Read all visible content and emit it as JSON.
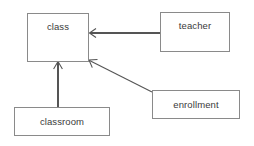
{
  "diagram": {
    "type": "entity-relationship-diagram",
    "width": 254,
    "height": 146,
    "background_color": "#ffffff",
    "box_border_color": "#8a8a8a",
    "arrow_color": "#555555",
    "text_color": "#3a3a3a",
    "entities": [
      {
        "id": "class",
        "label": "class",
        "x": 27,
        "y": 13,
        "width": 62,
        "height": 49
      },
      {
        "id": "teacher",
        "label": "teacher",
        "x": 160,
        "y": 12,
        "width": 70,
        "height": 40
      },
      {
        "id": "enrollment",
        "label": "enrollment",
        "x": 152,
        "y": 90,
        "width": 88,
        "height": 29
      },
      {
        "id": "classroom",
        "label": "classroom",
        "x": 14,
        "y": 107,
        "width": 96,
        "height": 29
      }
    ],
    "relationships": [
      {
        "id": "teacher-to-class",
        "from": "teacher",
        "to": "class",
        "from_point": [
          160,
          33
        ],
        "to_point": [
          90,
          33
        ],
        "style": "open-arrow"
      },
      {
        "id": "enrollment-to-class",
        "from": "enrollment",
        "to": "class",
        "from_point": [
          152,
          92
        ],
        "to_point": [
          89,
          61
        ],
        "style": "open-arrow"
      },
      {
        "id": "classroom-to-class",
        "from": "classroom",
        "to": "class",
        "from_point": [
          58,
          107
        ],
        "to_point": [
          58,
          62
        ],
        "style": "open-arrow"
      }
    ]
  }
}
